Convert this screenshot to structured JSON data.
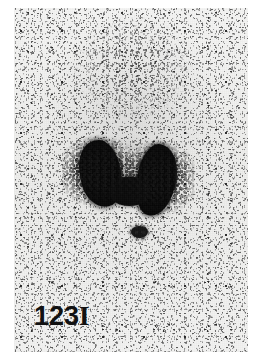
{
  "image": {
    "modality": "thyroid-scintigraphy",
    "width": 261,
    "height": 361,
    "background_color": "#ffffff",
    "field_color": "#f1f1f0",
    "count_color": "#070707"
  },
  "label": {
    "isotope_prefix": "123",
    "isotope_symbol": "I",
    "full_text": "123I"
  },
  "findings": {
    "gland_shape": "butterfly",
    "left_lobe": "left-thyroid-lobe",
    "right_lobe": "right-thyroid-lobe",
    "isthmus": "thyroid-isthmus",
    "inferior_focus": "pyramidal-lobe-focus"
  },
  "regions": {
    "background_counts": "scatter-background-counts",
    "upper_cloud": "upper-neck-count-cloud",
    "gland_halo": "perithyroidal-halo"
  }
}
